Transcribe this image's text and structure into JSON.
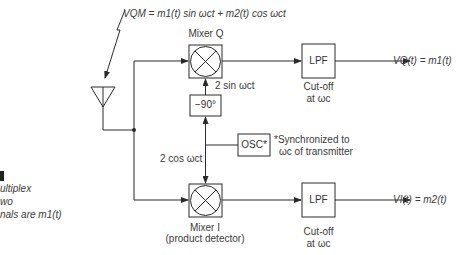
{
  "diagram": {
    "type": "quadrature demultiplexer block diagram",
    "input_signal": {
      "label": "V_QM = m₁(t) sin ω_c t + m₂(t) cos ω_c t",
      "text": "VQM = m1(t) sin ωct + m2(t) cos ωct"
    },
    "mixer_q": {
      "title": "Mixer Q"
    },
    "mixer_i": {
      "title": "Mixer I",
      "subtitle": "(product detector)"
    },
    "phase_shifter": {
      "label": "−90°"
    },
    "oscillator": {
      "label": "OSC*",
      "note_line1": "*Synchronized to",
      "note_line2": "ωc of transmitter"
    },
    "ref_sin": "2 sin ωct",
    "ref_cos": "2 cos ωct",
    "lpf_q": {
      "label": "LPF",
      "cutoff_line1": "Cut-off",
      "cutoff_line2": "at ωc"
    },
    "lpf_i": {
      "label": "LPF",
      "cutoff_line1": "Cut-off",
      "cutoff_line2": "at ωc"
    },
    "output_q": "VQ(t) = m1(t)",
    "output_i": "VI(t) = m2(t)",
    "caption_fragments": [
      "ultiplex",
      "wo",
      "nals are m1(t)"
    ]
  },
  "colors": {
    "line": "#2b2b2b",
    "text": "#3a3a3a",
    "background": "#ffffff"
  }
}
